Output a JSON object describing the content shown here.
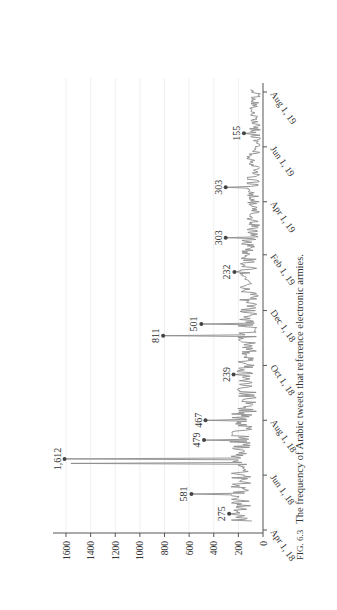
{
  "figure": {
    "caption_label": "FIG. 6.3",
    "caption_text": "The frequency of Arabic tweets that reference electronic armies."
  },
  "chart_data": {
    "type": "line",
    "title": "",
    "xlabel": "",
    "ylabel": "",
    "orientation": "rotated 90° counter-clockwise on page",
    "ylim": [
      0,
      1700
    ],
    "y_ticks": [
      0,
      200,
      400,
      600,
      800,
      1000,
      1200,
      1400,
      1600
    ],
    "x_tick_labels": [
      "Apr 1, 18",
      "Jun 1, 18",
      "Aug 1, 18",
      "Oct 1, 18",
      "Dec 1, 18",
      "Feb 1, 19",
      "Apr 1, 19",
      "Jun 1, 19",
      "Aug 1, 19"
    ],
    "x_range_days": [
      0,
      500
    ],
    "x_tick_days": [
      0,
      61,
      122,
      183,
      244,
      306,
      365,
      426,
      487
    ],
    "grid": "vertical-value gridlines light",
    "series": [
      {
        "name": "Arabic tweets referencing electronic armies (daily)",
        "color": "#8c8c8c",
        "baseline_range": [
          20,
          200
        ],
        "peaks": [
          {
            "day": 18,
            "value": 275,
            "label": "275"
          },
          {
            "day": 40,
            "value": 581,
            "label": "581"
          },
          {
            "day": 79,
            "value": 1612,
            "label": "1,612"
          },
          {
            "day": 74,
            "value": 1560,
            "label": ""
          },
          {
            "day": 100,
            "value": 479,
            "label": "479"
          },
          {
            "day": 122,
            "value": 467,
            "label": "467"
          },
          {
            "day": 173,
            "value": 239,
            "label": "239"
          },
          {
            "day": 216,
            "value": 811,
            "label": "811"
          },
          {
            "day": 229,
            "value": 501,
            "label": "501"
          },
          {
            "day": 287,
            "value": 232,
            "label": "232"
          },
          {
            "day": 325,
            "value": 303,
            "label": "303"
          },
          {
            "day": 381,
            "value": 303,
            "label": "303"
          },
          {
            "day": 441,
            "value": 155,
            "label": "155"
          }
        ]
      }
    ],
    "legend": "none"
  }
}
